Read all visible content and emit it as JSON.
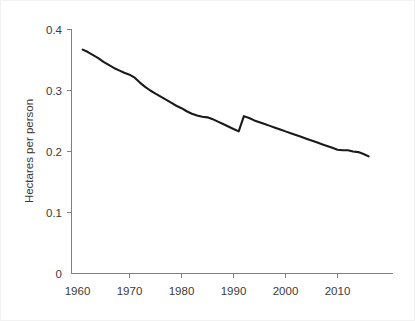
{
  "chart_data": {
    "type": "line",
    "title": "",
    "xlabel": "",
    "ylabel": "Hectares per person",
    "xlim": [
      1960,
      2017
    ],
    "ylim": [
      0,
      0.4
    ],
    "grid": false,
    "legend": "none",
    "x_ticks": [
      "1960",
      "1970",
      "1980",
      "1990",
      "2000",
      "2010"
    ],
    "x_tick_values": [
      1960,
      1970,
      1980,
      1990,
      2000,
      2010
    ],
    "y_ticks": [
      "0",
      "0.1",
      "0.2",
      "0.3",
      "0.4"
    ],
    "y_tick_values": [
      0,
      0.1,
      0.2,
      0.3,
      0.4
    ],
    "series": [
      {
        "name": "Hectares per person",
        "color": "#1a1a1a",
        "x": [
          1961,
          1962,
          1963,
          1964,
          1965,
          1966,
          1967,
          1968,
          1969,
          1970,
          1971,
          1972,
          1973,
          1974,
          1975,
          1976,
          1977,
          1978,
          1979,
          1980,
          1981,
          1982,
          1983,
          1984,
          1985,
          1986,
          1987,
          1988,
          1989,
          1990,
          1991,
          1992,
          1993,
          1994,
          1995,
          1996,
          1997,
          1998,
          1999,
          2000,
          2001,
          2002,
          2003,
          2004,
          2005,
          2006,
          2007,
          2008,
          2009,
          2010,
          2011,
          2012,
          2013,
          2014,
          2015,
          2016
        ],
        "values": [
          0.367,
          0.363,
          0.358,
          0.353,
          0.347,
          0.342,
          0.337,
          0.333,
          0.329,
          0.326,
          0.321,
          0.313,
          0.306,
          0.3,
          0.295,
          0.29,
          0.285,
          0.28,
          0.275,
          0.271,
          0.266,
          0.262,
          0.259,
          0.257,
          0.256,
          0.253,
          0.249,
          0.245,
          0.241,
          0.237,
          0.233,
          0.258,
          0.255,
          0.251,
          0.248,
          0.245,
          0.242,
          0.239,
          0.236,
          0.233,
          0.23,
          0.227,
          0.224,
          0.221,
          0.218,
          0.215,
          0.212,
          0.209,
          0.206,
          0.203,
          0.202,
          0.202,
          0.2,
          0.199,
          0.196,
          0.192
        ]
      }
    ]
  },
  "axes": {
    "y_axis_title": "Hectares per person"
  }
}
